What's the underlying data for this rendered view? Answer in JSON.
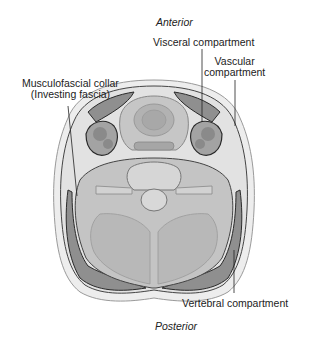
{
  "orientation": {
    "top": "Anterior",
    "bottom": "Posterior"
  },
  "labels": {
    "visceral": "Visceral compartment",
    "vascular_line1": "Vascular",
    "vascular_line2": "compartment",
    "musculofascial_line1": "Musculofascial collar",
    "musculofascial_line2": "(Investing fascia)",
    "vertebral": "Vertebral compartment"
  },
  "colors": {
    "skin": "#e6e6e6",
    "muscle": "#8f8f8f",
    "tissue": "#c8c8c8",
    "outline": "#2a2a2a",
    "background": "#ffffff"
  }
}
